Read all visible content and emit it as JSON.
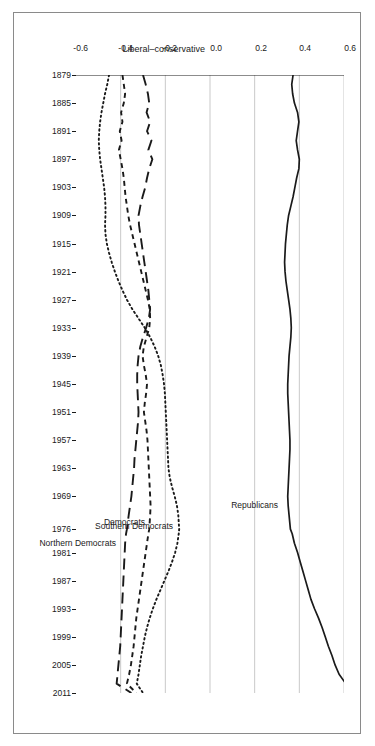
{
  "chart_data": {
    "type": "line",
    "title": "",
    "xlabel": "",
    "ylabel": "Liberal–conservative",
    "orientation": "rotated-90-on-page",
    "grid": true,
    "legend_position": "inline-labels",
    "xlim": [
      1879,
      2011
    ],
    "ylim": [
      -0.6,
      0.6
    ],
    "xticks": [
      1879,
      1885,
      1891,
      1897,
      1903,
      1909,
      1915,
      1921,
      1927,
      1933,
      1939,
      1945,
      1951,
      1957,
      1963,
      1969,
      1976,
      1981,
      1987,
      1993,
      1999,
      2005,
      2011
    ],
    "xtick_labels": [
      "1879",
      "1885",
      "1891",
      "1897",
      "1903",
      "1909",
      "1915",
      "1921",
      "1927",
      "1933",
      "1939",
      "1945",
      "1951",
      "1957",
      "1963",
      "1969",
      "1976",
      "1981",
      "1987",
      "1993",
      "1999",
      "2005",
      "2011"
    ],
    "yticks": [
      0.6,
      0.4,
      0.2,
      0.0,
      -0.2,
      -0.4,
      -0.6
    ],
    "ytick_labels": [
      "0.6",
      "0.4",
      "0.2",
      "0.0",
      "-0.2",
      "-0.4",
      "-0.6"
    ],
    "gridline_values": [
      0.6,
      0.4,
      0.2,
      0.0,
      -0.2,
      -0.4
    ],
    "x": [
      1879,
      1881,
      1883,
      1885,
      1887,
      1889,
      1891,
      1893,
      1895,
      1897,
      1899,
      1901,
      1903,
      1905,
      1907,
      1909,
      1911,
      1913,
      1915,
      1917,
      1919,
      1921,
      1923,
      1925,
      1927,
      1929,
      1931,
      1933,
      1935,
      1937,
      1939,
      1941,
      1943,
      1945,
      1947,
      1949,
      1951,
      1953,
      1955,
      1957,
      1959,
      1961,
      1963,
      1965,
      1967,
      1969,
      1971,
      1973,
      1976,
      1977,
      1979,
      1981,
      1983,
      1985,
      1987,
      1989,
      1991,
      1993,
      1995,
      1997,
      1999,
      2001,
      2003,
      2005,
      2007,
      2009,
      2011
    ],
    "series": [
      {
        "name": "Republicans",
        "style": "solid",
        "color": "#1a1a1a",
        "label_x": 1967,
        "label_y": 0.325,
        "values": [
          0.372,
          0.366,
          0.37,
          0.378,
          0.392,
          0.398,
          0.392,
          0.386,
          0.392,
          0.4,
          0.398,
          0.388,
          0.38,
          0.372,
          0.362,
          0.352,
          0.346,
          0.342,
          0.338,
          0.336,
          0.334,
          0.336,
          0.34,
          0.346,
          0.352,
          0.358,
          0.362,
          0.364,
          0.362,
          0.358,
          0.354,
          0.352,
          0.35,
          0.348,
          0.348,
          0.35,
          0.352,
          0.354,
          0.356,
          0.358,
          0.358,
          0.356,
          0.354,
          0.352,
          0.35,
          0.348,
          0.35,
          0.354,
          0.36,
          0.368,
          0.378,
          0.392,
          0.404,
          0.416,
          0.428,
          0.44,
          0.452,
          0.468,
          0.486,
          0.502,
          0.516,
          0.53,
          0.546,
          0.56,
          0.578,
          0.608,
          0.652
        ]
      },
      {
        "name": "Northern Democrats",
        "style": "longdash",
        "color": "#1a1a1a",
        "label_x": 1972,
        "label_y": -0.398,
        "values": [
          -0.3,
          -0.288,
          -0.278,
          -0.272,
          -0.284,
          -0.268,
          -0.282,
          -0.262,
          -0.276,
          -0.258,
          -0.272,
          -0.282,
          -0.29,
          -0.302,
          -0.312,
          -0.32,
          -0.318,
          -0.312,
          -0.306,
          -0.3,
          -0.294,
          -0.288,
          -0.282,
          -0.276,
          -0.272,
          -0.268,
          -0.274,
          -0.286,
          -0.3,
          -0.312,
          -0.32,
          -0.324,
          -0.326,
          -0.326,
          -0.324,
          -0.322,
          -0.32,
          -0.322,
          -0.326,
          -0.33,
          -0.334,
          -0.338,
          -0.34,
          -0.344,
          -0.348,
          -0.352,
          -0.358,
          -0.364,
          -0.372,
          -0.376,
          -0.38,
          -0.382,
          -0.384,
          -0.386,
          -0.388,
          -0.39,
          -0.392,
          -0.394,
          -0.396,
          -0.398,
          -0.4,
          -0.402,
          -0.406,
          -0.41,
          -0.414,
          -0.418,
          -0.352
        ]
      },
      {
        "name": "Democrats",
        "style": "dash",
        "color": "#1a1a1a",
        "label_x": 1971,
        "label_y": -0.268,
        "values": [
          -0.392,
          -0.386,
          -0.38,
          -0.386,
          -0.398,
          -0.392,
          -0.404,
          -0.396,
          -0.408,
          -0.4,
          -0.392,
          -0.386,
          -0.382,
          -0.378,
          -0.372,
          -0.366,
          -0.358,
          -0.348,
          -0.338,
          -0.328,
          -0.318,
          -0.308,
          -0.298,
          -0.288,
          -0.278,
          -0.27,
          -0.268,
          -0.272,
          -0.284,
          -0.296,
          -0.302,
          -0.296,
          -0.288,
          -0.282,
          -0.286,
          -0.292,
          -0.296,
          -0.29,
          -0.284,
          -0.28,
          -0.278,
          -0.276,
          -0.274,
          -0.272,
          -0.27,
          -0.268,
          -0.266,
          -0.268,
          -0.272,
          -0.276,
          -0.282,
          -0.288,
          -0.294,
          -0.3,
          -0.306,
          -0.312,
          -0.318,
          -0.324,
          -0.33,
          -0.334,
          -0.338,
          -0.342,
          -0.348,
          -0.354,
          -0.362,
          -0.372,
          -0.33
        ]
      },
      {
        "name": "Southern Democrats",
        "style": "dot",
        "color": "#1a1a1a",
        "label_x": 1968,
        "label_y": -0.142,
        "values": [
          -0.452,
          -0.46,
          -0.47,
          -0.478,
          -0.486,
          -0.492,
          -0.496,
          -0.498,
          -0.496,
          -0.492,
          -0.486,
          -0.48,
          -0.474,
          -0.47,
          -0.468,
          -0.468,
          -0.47,
          -0.468,
          -0.462,
          -0.452,
          -0.44,
          -0.426,
          -0.41,
          -0.392,
          -0.372,
          -0.348,
          -0.32,
          -0.292,
          -0.268,
          -0.248,
          -0.232,
          -0.22,
          -0.212,
          -0.206,
          -0.202,
          -0.2,
          -0.198,
          -0.196,
          -0.194,
          -0.192,
          -0.19,
          -0.188,
          -0.186,
          -0.18,
          -0.17,
          -0.158,
          -0.148,
          -0.142,
          -0.138,
          -0.14,
          -0.146,
          -0.156,
          -0.17,
          -0.186,
          -0.204,
          -0.222,
          -0.24,
          -0.256,
          -0.27,
          -0.282,
          -0.292,
          -0.3,
          -0.308,
          -0.314,
          -0.32,
          -0.328,
          -0.3
        ]
      }
    ]
  }
}
